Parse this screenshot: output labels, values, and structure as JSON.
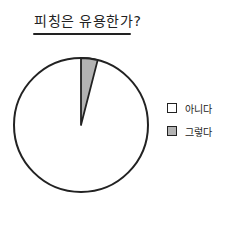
{
  "chart_data": {
    "type": "pie",
    "title": "피칭은 유용한가?",
    "categories": [
      "아니다",
      "그렇다"
    ],
    "values": [
      96,
      4
    ],
    "colors": [
      "#ffffff",
      "#b3b3b3"
    ],
    "legend_position": "right",
    "start_angle_deg": 0,
    "direction": "clockwise"
  },
  "legend": {
    "items": [
      {
        "label": "아니다",
        "color": "#ffffff"
      },
      {
        "label": "그렇다",
        "color": "#b3b3b3"
      }
    ]
  }
}
